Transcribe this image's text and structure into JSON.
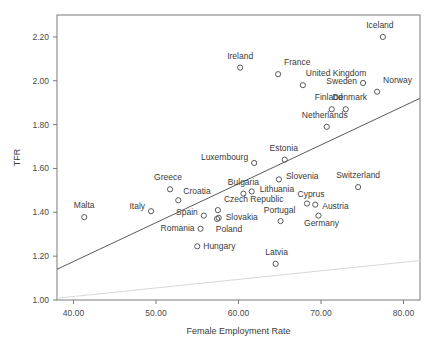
{
  "chart_data": {
    "type": "scatter",
    "title": "",
    "xlabel": "Female Employment Rate",
    "ylabel": "TFR",
    "xlim": [
      38.0,
      82.0
    ],
    "ylim": [
      1.0,
      2.3
    ],
    "xticks": [
      40.0,
      50.0,
      60.0,
      70.0,
      80.0
    ],
    "xtick_labels": [
      "40.00",
      "50.00",
      "60.00",
      "70.00",
      "80.00"
    ],
    "yticks": [
      1.0,
      1.2,
      1.4,
      1.6,
      1.8,
      2.0,
      2.2
    ],
    "ytick_labels": [
      "1.00",
      "1.20",
      "1.40",
      "1.60",
      "1.80",
      "2.00",
      "2.20"
    ],
    "grid": false,
    "legend": null,
    "marker": "open-circle",
    "points": [
      {
        "label": "Iceland",
        "x": 77.5,
        "y": 2.2,
        "lx": -3,
        "ly": -9,
        "anchor": "middle"
      },
      {
        "label": "Ireland",
        "x": 60.2,
        "y": 2.06,
        "lx": 0,
        "ly": -9,
        "anchor": "middle"
      },
      {
        "label": "France",
        "x": 64.8,
        "y": 2.03,
        "lx": 6,
        "ly": -9,
        "anchor": "start"
      },
      {
        "label": "United Kingdom",
        "x": 67.8,
        "y": 1.98,
        "lx": 3,
        "ly": -9,
        "anchor": "start"
      },
      {
        "label": "Norway",
        "x": 76.8,
        "y": 1.95,
        "lx": 6,
        "ly": -9,
        "anchor": "start"
      },
      {
        "label": "Sweden",
        "x": 75.1,
        "y": 1.99,
        "lx": -6,
        "ly": 1,
        "anchor": "end"
      },
      {
        "label": "Denmark",
        "x": 73.0,
        "y": 1.87,
        "lx": 4,
        "ly": -9,
        "anchor": "middle"
      },
      {
        "label": "Finland",
        "x": 71.3,
        "y": 1.87,
        "lx": -3,
        "ly": -9,
        "anchor": "middle"
      },
      {
        "label": "Netherlands",
        "x": 70.7,
        "y": 1.79,
        "lx": -2,
        "ly": -9,
        "anchor": "middle"
      },
      {
        "label": "Estonia",
        "x": 65.6,
        "y": 1.64,
        "lx": -1,
        "ly": -9,
        "anchor": "middle"
      },
      {
        "label": "Luxembourg",
        "x": 61.9,
        "y": 1.625,
        "lx": -6,
        "ly": -3,
        "anchor": "end"
      },
      {
        "label": "Slovenia",
        "x": 64.9,
        "y": 1.55,
        "lx": 7,
        "ly": 0,
        "anchor": "start"
      },
      {
        "label": "Switzerland",
        "x": 74.5,
        "y": 1.515,
        "lx": 0,
        "ly": -9,
        "anchor": "middle"
      },
      {
        "label": "Greece",
        "x": 51.7,
        "y": 1.505,
        "lx": -2,
        "ly": -9,
        "anchor": "middle"
      },
      {
        "label": "Bulgaria",
        "x": 60.6,
        "y": 1.485,
        "lx": 0,
        "ly": -9,
        "anchor": "middle"
      },
      {
        "label": "Lithuania",
        "x": 61.6,
        "y": 1.495,
        "lx": 8,
        "ly": 1,
        "anchor": "start"
      },
      {
        "label": "Croatia",
        "x": 52.7,
        "y": 1.455,
        "lx": 5,
        "ly": -6,
        "anchor": "start"
      },
      {
        "label": "Cyprus",
        "x": 68.3,
        "y": 1.44,
        "lx": 4,
        "ly": -7,
        "anchor": "middle"
      },
      {
        "label": "Italy",
        "x": 49.4,
        "y": 1.405,
        "lx": -6,
        "ly": -2,
        "anchor": "end"
      },
      {
        "label": "Czech Republic",
        "x": 57.5,
        "y": 1.41,
        "lx": 6,
        "ly": -8,
        "anchor": "start"
      },
      {
        "label": "Austria",
        "x": 69.3,
        "y": 1.435,
        "lx": 7,
        "ly": 4,
        "anchor": "start"
      },
      {
        "label": "Spain",
        "x": 55.8,
        "y": 1.385,
        "lx": -6,
        "ly": -1,
        "anchor": "end"
      },
      {
        "label": "Slovakia",
        "x": 57.6,
        "y": 1.375,
        "lx": 7,
        "ly": 2,
        "anchor": "start"
      },
      {
        "label": "Portugal",
        "x": 65.1,
        "y": 1.36,
        "lx": -1,
        "ly": -8,
        "anchor": "middle"
      },
      {
        "label": "Germany",
        "x": 69.7,
        "y": 1.385,
        "lx": 3,
        "ly": 10,
        "anchor": "middle"
      },
      {
        "label": "Malta",
        "x": 41.3,
        "y": 1.378,
        "lx": 0,
        "ly": -9,
        "anchor": "middle"
      },
      {
        "label": "Romania",
        "x": 55.4,
        "y": 1.325,
        "lx": -6,
        "ly": 2,
        "anchor": "end"
      },
      {
        "label": "Poland",
        "x": 57.4,
        "y": 1.37,
        "lx": 12,
        "ly": 13,
        "anchor": "middle"
      },
      {
        "label": "Hungary",
        "x": 55.0,
        "y": 1.245,
        "lx": 6,
        "ly": 3,
        "anchor": "start"
      },
      {
        "label": "Latvia",
        "x": 64.5,
        "y": 1.165,
        "lx": 1,
        "ly": -9,
        "anchor": "middle"
      }
    ],
    "trend_lines": [
      {
        "name": "fit-line",
        "x0": 38.0,
        "y0": 1.14,
        "x1": 82.0,
        "y1": 1.92,
        "style": "solid-dark"
      },
      {
        "name": "faint-line",
        "x0": 38.0,
        "y0": 1.008,
        "x1": 82.0,
        "y1": 1.18,
        "style": "solid-faint"
      }
    ]
  },
  "colors": {
    "marker_stroke": "#5a5a5a",
    "frame": "#7a7a7a",
    "fit_line": "#5a5a5a",
    "faint_line": "#d8d8d8",
    "text": "#3a3a3a",
    "background": "#ffffff"
  }
}
